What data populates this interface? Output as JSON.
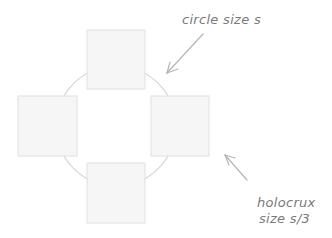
{
  "diagram": {
    "circle": {
      "cx": 116,
      "cy": 126,
      "r": 60,
      "stroke": "#d6d6d6"
    },
    "squares": [
      {
        "name": "top",
        "x": 87,
        "y": 30,
        "w": 58,
        "h": 59
      },
      {
        "name": "left",
        "x": 18,
        "y": 96,
        "w": 59,
        "h": 60
      },
      {
        "name": "right",
        "x": 151,
        "y": 96,
        "w": 58,
        "h": 60
      },
      {
        "name": "bottom",
        "x": 87,
        "y": 163,
        "w": 58,
        "h": 60
      }
    ],
    "square_fill": "#f6f6f6",
    "square_stroke": "#e0e0e0",
    "arrow_color": "#b5b5b5"
  },
  "annotations": {
    "circle_label": "circle size s",
    "holocrux_label_line1": "holocrux",
    "holocrux_label_line2": "size s/3"
  }
}
